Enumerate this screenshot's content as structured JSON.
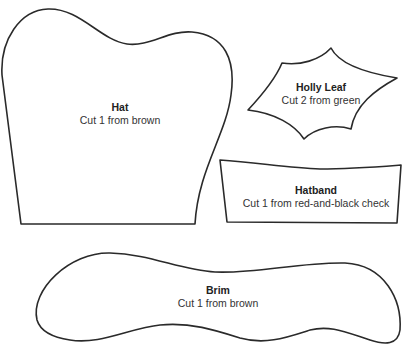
{
  "pieces": [
    {
      "id": "hat",
      "name": "Hat",
      "instruction": "Cut 1 from brown"
    },
    {
      "id": "holly-leaf",
      "name": "Holly Leaf",
      "instruction": "Cut 2 from green"
    },
    {
      "id": "hatband",
      "name": "Hatband",
      "instruction": "Cut 1 from red-and-black check"
    },
    {
      "id": "brim",
      "name": "Brim",
      "instruction": "Cut 1 from brown"
    }
  ],
  "colors": {
    "outline": "#2a2a2a",
    "text": "#333333",
    "background": "#ffffff"
  }
}
